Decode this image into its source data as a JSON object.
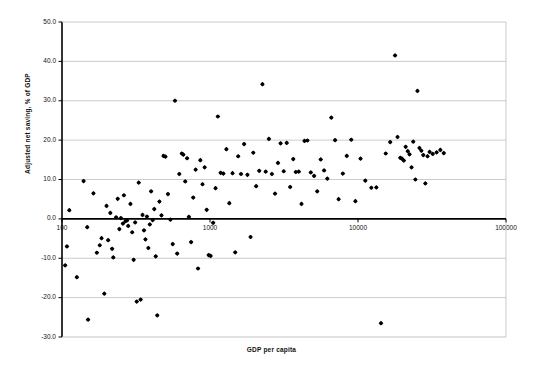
{
  "chart_data": {
    "type": "scatter",
    "title": "",
    "xlabel": "GDP per capita",
    "ylabel": "Adjusted net saving, % of GDP",
    "xscale": "log",
    "xlim": [
      100,
      100000
    ],
    "ylim": [
      -30.0,
      50.0
    ],
    "xticks": [
      100,
      1000,
      10000,
      100000
    ],
    "xtick_labels": [
      "100",
      "1000",
      "10000",
      "100000"
    ],
    "yticks": [
      -30.0,
      -20.0,
      -10.0,
      0.0,
      10.0,
      20.0,
      30.0,
      40.0,
      50.0
    ],
    "ytick_labels": [
      "-30.0",
      "-20.0",
      "-10.0",
      "0.0",
      "10.0",
      "20.0",
      "30.0",
      "40.0",
      "50.0"
    ],
    "grid": "horizontal",
    "legend": null,
    "marker": "diamond",
    "marker_color": "#000000",
    "zero_line": 0.0,
    "series": [
      {
        "name": "Countries",
        "points": [
          [
            105,
            -11.8
          ],
          [
            108,
            -7.0
          ],
          [
            112,
            2.2
          ],
          [
            126,
            -14.8
          ],
          [
            140,
            9.6
          ],
          [
            148,
            -2.1
          ],
          [
            150,
            -25.6
          ],
          [
            163,
            6.5
          ],
          [
            172,
            -8.6
          ],
          [
            180,
            -6.7
          ],
          [
            185,
            -4.9
          ],
          [
            193,
            -19.0
          ],
          [
            200,
            3.3
          ],
          [
            205,
            -5.4
          ],
          [
            212,
            1.5
          ],
          [
            218,
            -7.6
          ],
          [
            222,
            -9.8
          ],
          [
            232,
            0.4
          ],
          [
            238,
            5.1
          ],
          [
            244,
            -2.6
          ],
          [
            250,
            0.2
          ],
          [
            258,
            -1.2
          ],
          [
            262,
            6.0
          ],
          [
            268,
            -0.6
          ],
          [
            275,
            -0.4
          ],
          [
            280,
            -1.8
          ],
          [
            290,
            3.8
          ],
          [
            298,
            -3.4
          ],
          [
            305,
            -10.4
          ],
          [
            312,
            -0.9
          ],
          [
            320,
            -21.0
          ],
          [
            330,
            9.2
          ],
          [
            340,
            -20.5
          ],
          [
            350,
            1.0
          ],
          [
            358,
            -2.9
          ],
          [
            366,
            -5.2
          ],
          [
            375,
            0.6
          ],
          [
            383,
            -7.4
          ],
          [
            392,
            -1.4
          ],
          [
            400,
            7.0
          ],
          [
            410,
            -0.3
          ],
          [
            420,
            2.5
          ],
          [
            430,
            -9.5
          ],
          [
            440,
            -24.5
          ],
          [
            455,
            4.4
          ],
          [
            470,
            0.9
          ],
          [
            485,
            16.0
          ],
          [
            500,
            15.8
          ],
          [
            520,
            6.3
          ],
          [
            540,
            -0.2
          ],
          [
            560,
            -6.4
          ],
          [
            580,
            30.0
          ],
          [
            600,
            -8.8
          ],
          [
            620,
            11.4
          ],
          [
            645,
            16.6
          ],
          [
            660,
            16.3
          ],
          [
            680,
            9.5
          ],
          [
            700,
            15.4
          ],
          [
            720,
            0.5
          ],
          [
            745,
            -5.9
          ],
          [
            770,
            5.4
          ],
          [
            800,
            12.5
          ],
          [
            830,
            -12.6
          ],
          [
            860,
            14.9
          ],
          [
            890,
            8.8
          ],
          [
            920,
            13.1
          ],
          [
            950,
            2.3
          ],
          [
            980,
            -9.2
          ],
          [
            1010,
            -9.4
          ],
          [
            1050,
            -1.0
          ],
          [
            1090,
            7.8
          ],
          [
            1130,
            26.0
          ],
          [
            1180,
            11.7
          ],
          [
            1230,
            11.5
          ],
          [
            1290,
            17.7
          ],
          [
            1350,
            4.0
          ],
          [
            1420,
            11.6
          ],
          [
            1480,
            -8.5
          ],
          [
            1550,
            15.9
          ],
          [
            1620,
            11.4
          ],
          [
            1700,
            19.0
          ],
          [
            1790,
            11.2
          ],
          [
            1880,
            -4.6
          ],
          [
            1960,
            16.8
          ],
          [
            2050,
            8.3
          ],
          [
            2150,
            12.2
          ],
          [
            2260,
            34.2
          ],
          [
            2380,
            12.0
          ],
          [
            2500,
            20.3
          ],
          [
            2620,
            11.4
          ],
          [
            2750,
            6.4
          ],
          [
            2880,
            14.2
          ],
          [
            3000,
            19.2
          ],
          [
            3150,
            12.1
          ],
          [
            3300,
            19.3
          ],
          [
            3480,
            8.1
          ],
          [
            3650,
            15.2
          ],
          [
            3800,
            11.9
          ],
          [
            3980,
            12.0
          ],
          [
            4150,
            3.8
          ],
          [
            4350,
            19.8
          ],
          [
            4550,
            19.9
          ],
          [
            4800,
            11.8
          ],
          [
            5050,
            10.9
          ],
          [
            5300,
            7.0
          ],
          [
            5600,
            15.1
          ],
          [
            5900,
            12.3
          ],
          [
            6200,
            10.2
          ],
          [
            6600,
            25.7
          ],
          [
            7000,
            20.0
          ],
          [
            7400,
            5.0
          ],
          [
            7900,
            11.5
          ],
          [
            8400,
            16.0
          ],
          [
            9000,
            20.1
          ],
          [
            9600,
            4.5
          ],
          [
            10400,
            15.3
          ],
          [
            11200,
            9.7
          ],
          [
            12300,
            7.9
          ],
          [
            13300,
            8.0
          ],
          [
            14300,
            -26.5
          ],
          [
            15400,
            16.6
          ],
          [
            16500,
            19.5
          ],
          [
            17800,
            41.5
          ],
          [
            18500,
            20.8
          ],
          [
            19300,
            15.5
          ],
          [
            19800,
            15.3
          ],
          [
            20400,
            14.8
          ],
          [
            21000,
            18.3
          ],
          [
            21700,
            17.2
          ],
          [
            22300,
            16.4
          ],
          [
            23000,
            13.1
          ],
          [
            23600,
            19.6
          ],
          [
            24400,
            10.0
          ],
          [
            25200,
            32.5
          ],
          [
            26000,
            18.0
          ],
          [
            26800,
            17.3
          ],
          [
            27600,
            16.2
          ],
          [
            28500,
            9.0
          ],
          [
            29500,
            15.9
          ],
          [
            30500,
            17.0
          ],
          [
            32000,
            16.5
          ],
          [
            34000,
            16.9
          ],
          [
            36000,
            17.5
          ],
          [
            38000,
            16.7
          ]
        ]
      }
    ]
  },
  "axes": {
    "y_title": "Adjusted net saving, % of GDP",
    "x_title": "GDP per capita"
  }
}
